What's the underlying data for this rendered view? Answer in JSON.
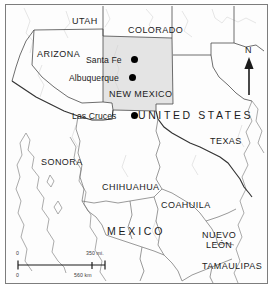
{
  "map": {
    "title": "Southwestern United States and Northern Mexico reference map",
    "countries": [
      {
        "name": "UNITED STATES",
        "x": 132,
        "y": 105
      },
      {
        "name": "MEXICO",
        "x": 101,
        "y": 221
      }
    ],
    "states": [
      {
        "name": "UTAH",
        "x": 66,
        "y": 12
      },
      {
        "name": "COLORADO",
        "x": 122,
        "y": 21
      },
      {
        "name": "ARIZONA",
        "x": 31,
        "y": 45
      },
      {
        "name": "NEW MEXICO",
        "x": 103,
        "y": 85
      },
      {
        "name": "TEXAS",
        "x": 204,
        "y": 132
      },
      {
        "name": "SONORA",
        "x": 35,
        "y": 153
      },
      {
        "name": "CHIHUAHUA",
        "x": 96,
        "y": 178
      },
      {
        "name": "COAHUILA",
        "x": 155,
        "y": 196
      },
      {
        "name": "NUEVO",
        "x": 196,
        "y": 226
      },
      {
        "name": "LEÓN",
        "x": 200,
        "y": 236
      },
      {
        "name": "TAMAULIPAS",
        "x": 196,
        "y": 257
      }
    ],
    "cities": [
      {
        "name": "Santa Fe",
        "label_x": 80,
        "label_y": 51,
        "dot_x": 125,
        "dot_y": 51
      },
      {
        "name": "Albuquerque",
        "label_x": 63,
        "label_y": 69,
        "dot_x": 123,
        "dot_y": 69
      },
      {
        "name": "Las Cruces",
        "label_x": 66,
        "label_y": 107,
        "dot_x": 125,
        "dot_y": 107
      }
    ],
    "compass": {
      "label": "N",
      "x": 240,
      "y": 45
    },
    "scalebar": {
      "miles_zero": "0",
      "miles_max": "350 mi.",
      "km_zero": "0",
      "km_max": "560 km",
      "x": 12,
      "y": 248
    },
    "colors": {
      "highlight_fill": "#e4e4e4",
      "border_line": "#4a4a4a",
      "coast_line": "#9a9a9a",
      "frame": "#7d7d7d",
      "text": "#1b1b1b",
      "marker": "#000000"
    }
  }
}
